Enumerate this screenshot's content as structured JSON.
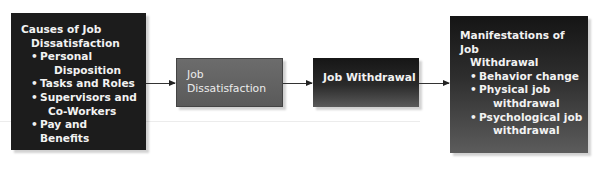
{
  "diagram": {
    "type": "flowchart",
    "nodes": [
      {
        "id": "causes",
        "title_line1": "Causes of Job",
        "title_line2": "Dissatisfaction",
        "items": [
          {
            "line1": "Personal",
            "line2": "Disposition"
          },
          {
            "line1": "Tasks and Roles",
            "line2": ""
          },
          {
            "line1": "Supervisors and",
            "line2": "Co-Workers"
          },
          {
            "line1": "Pay and Benefits",
            "line2": ""
          }
        ]
      },
      {
        "id": "job-dissatisfaction",
        "title_line1": "Job",
        "title_line2": "Dissatisfaction"
      },
      {
        "id": "job-withdrawal",
        "title_line1": "Job Withdrawal"
      },
      {
        "id": "manifestations",
        "title_line1": "Manifestations of Job",
        "title_line2": "Withdrawal",
        "items": [
          {
            "line1": "Behavior change",
            "line2": ""
          },
          {
            "line1": "Physical job",
            "line2": "withdrawal"
          },
          {
            "line1": "Psychological job",
            "line2": "withdrawal"
          }
        ]
      }
    ],
    "edges": [
      {
        "from": "causes",
        "to": "job-dissatisfaction"
      },
      {
        "from": "job-dissatisfaction",
        "to": "job-withdrawal"
      },
      {
        "from": "job-withdrawal",
        "to": "manifestations"
      }
    ],
    "colors": {
      "dark_box": "#1c1c1c",
      "mid_box": "#656565",
      "text": "#f2f2f2",
      "arrow": "#333333"
    }
  }
}
